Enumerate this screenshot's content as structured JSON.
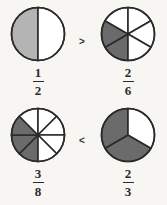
{
  "page": {
    "background_color": "#f7f6f2"
  },
  "colors": {
    "shaded_light": "#b4b4b4",
    "shaded_dark": "#6b6b6b",
    "unshaded": "#ffffff",
    "stroke": "#2b2b2b",
    "text": "#2b2b2b"
  },
  "comparisons": [
    {
      "id": "comparison-row-1",
      "operator": ">",
      "operator_name": "greater-than",
      "left": {
        "id": "fraction-one-half",
        "numerator": "1",
        "denominator": "2",
        "total_parts": 2,
        "shaded_parts": 1,
        "start_angle": 180,
        "shade_color": "#b4b4b4",
        "value": 0.5
      },
      "right": {
        "id": "fraction-two-sixths",
        "numerator": "2",
        "denominator": "6",
        "total_parts": 6,
        "shaded_parts": 2,
        "start_angle": 180,
        "shade_color": "#6b6b6b",
        "value": 0.3333
      }
    },
    {
      "id": "comparison-row-2",
      "operator": "<",
      "operator_name": "less-than",
      "left": {
        "id": "fraction-three-eighths",
        "numerator": "3",
        "denominator": "8",
        "total_parts": 8,
        "shaded_parts": 3,
        "start_angle": 180,
        "shade_color": "#6b6b6b",
        "value": 0.375
      },
      "right": {
        "id": "fraction-two-thirds",
        "numerator": "2",
        "denominator": "3",
        "total_parts": 3,
        "shaded_parts": 2,
        "start_angle": 120,
        "shade_color": "#6b6b6b",
        "value": 0.6667
      }
    }
  ],
  "chart_data": {
    "type": "pie",
    "charts": [
      {
        "label": "1/2",
        "total_parts": 2,
        "shaded_parts": 1,
        "values": [
          0.5,
          0.5
        ],
        "slice_states": [
          "shaded",
          "unshaded"
        ],
        "fraction_value": 0.5
      },
      {
        "label": "2/6",
        "total_parts": 6,
        "shaded_parts": 2,
        "values": [
          0.1667,
          0.1667,
          0.1667,
          0.1667,
          0.1667,
          0.1667
        ],
        "slice_states": [
          "shaded",
          "shaded",
          "unshaded",
          "unshaded",
          "unshaded",
          "unshaded"
        ],
        "fraction_value": 0.3333
      },
      {
        "label": "3/8",
        "total_parts": 8,
        "shaded_parts": 3,
        "values": [
          0.125,
          0.125,
          0.125,
          0.125,
          0.125,
          0.125,
          0.125,
          0.125
        ],
        "slice_states": [
          "shaded",
          "shaded",
          "shaded",
          "unshaded",
          "unshaded",
          "unshaded",
          "unshaded",
          "unshaded"
        ],
        "fraction_value": 0.375
      },
      {
        "label": "2/3",
        "total_parts": 3,
        "shaded_parts": 2,
        "values": [
          0.3333,
          0.3333,
          0.3333
        ],
        "slice_states": [
          "shaded",
          "shaded",
          "unshaded"
        ],
        "fraction_value": 0.6667
      }
    ],
    "relations": [
      "1/2 > 2/6",
      "3/8 < 2/3"
    ],
    "legend": [],
    "grid": false
  }
}
